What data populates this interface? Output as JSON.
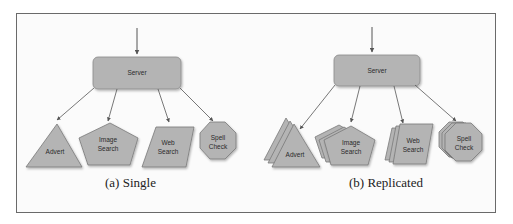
{
  "figure": {
    "panels": [
      {
        "id": "single",
        "caption": "(a) Single",
        "server": {
          "label": "Server"
        },
        "services": [
          {
            "label_line1": "Advert",
            "label_line2": "",
            "shape": "triangle"
          },
          {
            "label_line1": "Image",
            "label_line2": "Search",
            "shape": "pentagon"
          },
          {
            "label_line1": "Web",
            "label_line2": "Search",
            "shape": "parallelogram"
          },
          {
            "label_line1": "Spell",
            "label_line2": "Check",
            "shape": "octagon"
          }
        ]
      },
      {
        "id": "replicated",
        "caption": "(b) Replicated",
        "server": {
          "label": "Server"
        },
        "services": [
          {
            "label_line1": "Advert",
            "label_line2": "",
            "shape": "triangle-stack"
          },
          {
            "label_line1": "Image",
            "label_line2": "Search",
            "shape": "pentagon-stack"
          },
          {
            "label_line1": "Web",
            "label_line2": "Search",
            "shape": "parallelogram-stack"
          },
          {
            "label_line1": "Spell",
            "label_line2": "Check",
            "shape": "octagon-stack"
          }
        ]
      }
    ],
    "colors": {
      "fill": "#b4b4b4",
      "stroke": "#7a7a7a",
      "arrow": "#555555",
      "frame": "#6a6a6a"
    }
  }
}
